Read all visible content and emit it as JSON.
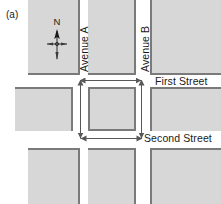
{
  "figure": {
    "label": "(a)",
    "type": "street-grid-map",
    "width": 221,
    "height": 204,
    "background": "#ffffff"
  },
  "colors": {
    "block_fill": "#d7d7d7",
    "block_shadow": "#7a7a7a",
    "text": "#1a1a1a",
    "dimension_line": "#58585a"
  },
  "compass": {
    "north_label": "N",
    "icon": "compass-rose-north-arrow"
  },
  "avenues": [
    {
      "id": "avenue-a",
      "label": "Avenue A",
      "orientation": "vertical",
      "x": 82,
      "label_x": 83,
      "label_y": 72
    },
    {
      "id": "avenue-b",
      "label": "Avenue B",
      "orientation": "vertical",
      "x": 143,
      "label_x": 144,
      "label_y": 72
    }
  ],
  "streets": [
    {
      "id": "first-street",
      "label": "First Street",
      "orientation": "horizontal",
      "label_x": 155,
      "label_y": 78
    },
    {
      "id": "second-street",
      "label": "Second Street",
      "orientation": "horizontal",
      "label_x": 144,
      "label_y": 131
    }
  ],
  "blocks": [
    {
      "id": "block-nw",
      "row": "north",
      "col": "west",
      "x": 28,
      "y": -10,
      "w": 52,
      "h": 85,
      "shadow": "bottom-right"
    },
    {
      "id": "block-n",
      "row": "north",
      "col": "center",
      "x": 88,
      "y": -10,
      "w": 48,
      "h": 85,
      "shadow": "bottom-right"
    },
    {
      "id": "block-ne",
      "row": "north",
      "col": "east",
      "x": 150,
      "y": -10,
      "w": 78,
      "h": 85,
      "shadow": "bottom-left"
    },
    {
      "id": "block-w",
      "row": "middle",
      "col": "west",
      "x": 15,
      "y": 87,
      "w": 58,
      "h": 44,
      "shadow": "top-right"
    },
    {
      "id": "block-center",
      "row": "middle",
      "col": "center",
      "x": 88,
      "y": 87,
      "w": 48,
      "h": 44,
      "shadow": "all"
    },
    {
      "id": "block-e",
      "row": "middle",
      "col": "east",
      "x": 150,
      "y": 87,
      "w": 78,
      "h": 44,
      "shadow": "top-left"
    },
    {
      "id": "block-sw",
      "row": "south",
      "col": "west",
      "x": 28,
      "y": 148,
      "w": 52,
      "h": 66,
      "shadow": "top-right"
    },
    {
      "id": "block-s",
      "row": "south",
      "col": "center",
      "x": 88,
      "y": 148,
      "w": 48,
      "h": 66,
      "shadow": "top-right"
    },
    {
      "id": "block-se",
      "row": "south",
      "col": "east",
      "x": 150,
      "y": 148,
      "w": 78,
      "h": 66,
      "shadow": "top-left"
    }
  ],
  "dimensions": [
    {
      "id": "dim-top",
      "orientation": "horizontal",
      "x": 80,
      "y": 80,
      "length": 62,
      "arrows": "both"
    },
    {
      "id": "dim-bottom",
      "orientation": "horizontal",
      "x": 80,
      "y": 138,
      "length": 62,
      "arrows": "both"
    },
    {
      "id": "dim-left",
      "orientation": "vertical",
      "x": 80,
      "y": 80,
      "length": 58,
      "arrows": "both"
    },
    {
      "id": "dim-right",
      "orientation": "vertical",
      "x": 142,
      "y": 80,
      "length": 58,
      "arrows": "both"
    }
  ]
}
